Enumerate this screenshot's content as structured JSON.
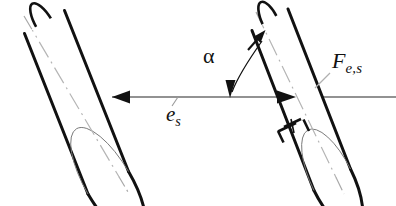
{
  "figure": {
    "background_color": "#ffffff",
    "stroke_color": "#111111",
    "centerline_color": "#9a9a9a",
    "axis_color": "#6e6e6e",
    "width": 396,
    "height": 206
  },
  "labels": {
    "axis_symbol": "e",
    "axis_subscript": "s",
    "angle_symbol": "α",
    "force_symbol": "F",
    "force_subscript": "e,s"
  },
  "icons": {
    "axis_arrow_left": "arrowhead-left-icon",
    "axis_arrow_right": "arrowhead-right-icon",
    "angle_arrow": "arrowhead-down-icon",
    "force_arrow": "arrowhead-up-right-icon"
  },
  "geometry": {
    "axis_line": {
      "x1": 112,
      "y1": 97,
      "x2": 396,
      "y2": 97
    },
    "left_cylinder": {
      "axis_start": [
        30,
        26
      ],
      "axis_end": [
        122,
        182
      ],
      "angle_deg": 59.5
    },
    "right_cylinder": {
      "axis_start": [
        262,
        22
      ],
      "axis_end": [
        338,
        180
      ],
      "angle_deg": 64.3
    },
    "angle_arc": {
      "center": [
        230,
        97
      ],
      "radius": 58,
      "from_deg": 270,
      "to_deg": 296
    }
  }
}
